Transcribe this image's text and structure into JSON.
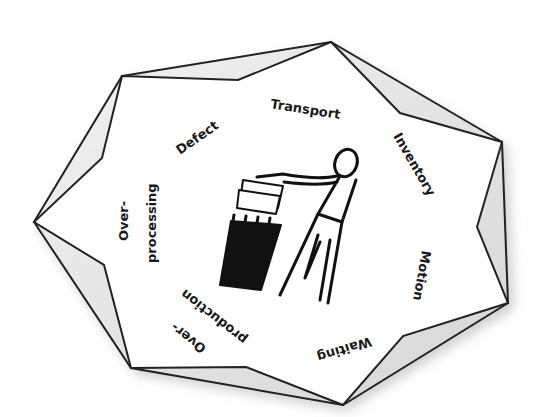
{
  "diagram": {
    "type": "star-polygon-with-labels",
    "center_icon": "person-throwing-paper-in-trash-icon",
    "colors": {
      "outline": "#222222",
      "shadow": "#c8c8c8",
      "fold_fill": "#e6e6e6",
      "inner_fill": "#ffffff",
      "text": "#1a1a1a"
    },
    "labels": {
      "transport": "Transport",
      "inventory": "Inventory",
      "motion": "Motion",
      "waiting": "Waiting",
      "overproduction_line1": "Over-",
      "overproduction_line2": "production",
      "overprocessing_line1": "Over-",
      "overprocessing_line2": "processing",
      "defect": "Defect"
    }
  }
}
